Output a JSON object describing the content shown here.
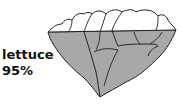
{
  "figure": {
    "item_name": "lettuce",
    "percentage_label": "95%",
    "fill_percent": 95,
    "fill_color": "#a8a8a8",
    "outline_color": "#222222",
    "icon": "lettuce-icon"
  }
}
